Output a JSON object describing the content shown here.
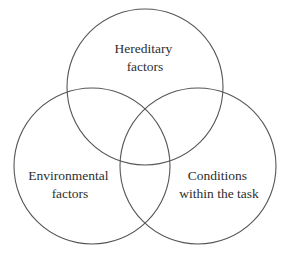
{
  "diagram": {
    "type": "venn",
    "stroke_color": "#555555",
    "text_color": "#2e2e2e",
    "circles": [
      {
        "id": "hereditary",
        "cx": 145,
        "cy": 87,
        "r": 78,
        "label_lines": [
          "Hereditary",
          "factors"
        ],
        "label_x": 145,
        "label_y": [
          53,
          71
        ]
      },
      {
        "id": "environmental",
        "cx": 92,
        "cy": 166,
        "r": 78,
        "label_lines": [
          "Environmental",
          "factors"
        ],
        "label_x": 70,
        "label_y": [
          180,
          198
        ]
      },
      {
        "id": "conditions",
        "cx": 198,
        "cy": 166,
        "r": 78,
        "label_lines": [
          "Conditions",
          "within the task"
        ],
        "label_x": 219,
        "label_y": [
          180,
          198
        ]
      }
    ]
  }
}
